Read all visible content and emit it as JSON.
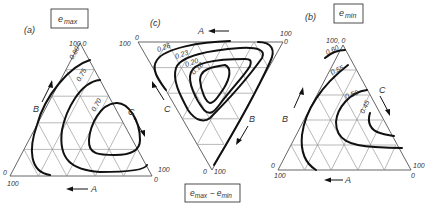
{
  "figure": {
    "panels": [
      {
        "id": "a",
        "tag": "(a)",
        "title": "e max",
        "title_main": "e",
        "title_sub": "max",
        "axis_labels": {
          "A": "A",
          "B": "B",
          "C": "C"
        },
        "corner_labels": {
          "top": "100  0",
          "left_a": "0",
          "left_b": "100",
          "right_a": "100",
          "right_b": "0"
        },
        "contours": [
          "0.80",
          "0.75",
          "0.70"
        ]
      },
      {
        "id": "c",
        "tag": "(c)",
        "title": "e max − e min",
        "title_main1": "e",
        "title_sub1": "max",
        "title_sep": " − ",
        "title_main2": "e",
        "title_sub2": "min",
        "axis_labels": {
          "A": "A",
          "B": "B",
          "C": "C"
        },
        "corner_labels": {
          "left_a": "100",
          "left_b": "0",
          "right_a": "100",
          "right_b": "0",
          "bottom_a": "0",
          "bottom_b": "100"
        },
        "contours": [
          "0.26",
          "0.23",
          "0.20",
          "0.18"
        ]
      },
      {
        "id": "b",
        "tag": "(b)",
        "title": "e min",
        "title_main": "e",
        "title_sub": "min",
        "axis_labels": {
          "A": "A",
          "B": "B",
          "C": "C"
        },
        "corner_labels": {
          "top": "100, 0",
          "left_a": "0",
          "left_b": "100",
          "right_a": "100",
          "right_b": "0"
        },
        "contours": [
          "0.60",
          "0.55",
          "0.50",
          "0.45"
        ]
      }
    ]
  }
}
